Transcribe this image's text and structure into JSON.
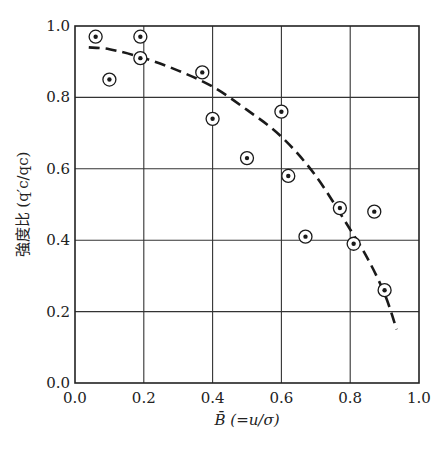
{
  "chart_data": {
    "type": "scatter",
    "title": "",
    "xlabel": "B̄ (=u/σ)",
    "ylabel": "強度比 (q′c/qc)",
    "xlim": [
      0.0,
      1.0
    ],
    "ylim": [
      0.0,
      1.0
    ],
    "grid": true,
    "x_ticks": [
      "0.0",
      "0.2",
      "0.4",
      "0.6",
      "0.8",
      "1.0"
    ],
    "y_ticks": [
      "0.0",
      "0.2",
      "0.4",
      "0.6",
      "0.8",
      "1.0"
    ],
    "legend": null,
    "series": [
      {
        "name": "measured",
        "marker": "circled-dot",
        "points": [
          {
            "x": 0.06,
            "y": 0.97
          },
          {
            "x": 0.1,
            "y": 0.85
          },
          {
            "x": 0.19,
            "y": 0.97
          },
          {
            "x": 0.19,
            "y": 0.91
          },
          {
            "x": 0.37,
            "y": 0.87
          },
          {
            "x": 0.4,
            "y": 0.74
          },
          {
            "x": 0.5,
            "y": 0.63
          },
          {
            "x": 0.6,
            "y": 0.76
          },
          {
            "x": 0.62,
            "y": 0.58
          },
          {
            "x": 0.67,
            "y": 0.41
          },
          {
            "x": 0.77,
            "y": 0.49
          },
          {
            "x": 0.81,
            "y": 0.39
          },
          {
            "x": 0.87,
            "y": 0.48
          },
          {
            "x": 0.9,
            "y": 0.26
          }
        ]
      },
      {
        "name": "trend",
        "style": "dashed",
        "points": [
          {
            "x": 0.04,
            "y": 0.94
          },
          {
            "x": 0.1,
            "y": 0.935
          },
          {
            "x": 0.2,
            "y": 0.91
          },
          {
            "x": 0.3,
            "y": 0.875
          },
          {
            "x": 0.4,
            "y": 0.83
          },
          {
            "x": 0.5,
            "y": 0.765
          },
          {
            "x": 0.6,
            "y": 0.69
          },
          {
            "x": 0.7,
            "y": 0.58
          },
          {
            "x": 0.8,
            "y": 0.43
          },
          {
            "x": 0.85,
            "y": 0.35
          },
          {
            "x": 0.9,
            "y": 0.25
          },
          {
            "x": 0.935,
            "y": 0.15
          }
        ]
      }
    ]
  }
}
